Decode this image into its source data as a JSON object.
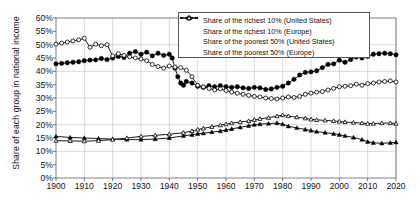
{
  "chart_data": {
    "type": "line",
    "title": "",
    "xlabel": "",
    "ylabel": "Share of each group in national income",
    "xlim": [
      1900,
      2020
    ],
    "ylim": [
      0,
      60
    ],
    "y_unit": "%",
    "grid": true,
    "legend_position": "top-right",
    "xticks": [
      1900,
      1910,
      1920,
      1930,
      1940,
      1950,
      1960,
      1970,
      1980,
      1990,
      2000,
      2010,
      2020
    ],
    "ytick_labels": [
      "0%",
      "5%",
      "10%",
      "15%",
      "20%",
      "25%",
      "30%",
      "35%",
      "40%",
      "45%",
      "50%",
      "55%",
      "60%"
    ],
    "yticks": [
      0,
      5,
      10,
      15,
      20,
      25,
      30,
      35,
      40,
      45,
      50,
      55,
      60
    ],
    "colors": {
      "filled": "#000000",
      "hollow": "#000000",
      "grid": "#c9c9c9",
      "axis": "#808080"
    },
    "series": [
      {
        "name": "Share of the richest 10% (United States)",
        "marker": "filled-circle",
        "x": [
          1900,
          1902,
          1904,
          1906,
          1908,
          1910,
          1912,
          1914,
          1916,
          1918,
          1920,
          1922,
          1924,
          1926,
          1928,
          1930,
          1932,
          1934,
          1936,
          1938,
          1940,
          1941,
          1942,
          1943,
          1944,
          1945,
          1946,
          1948,
          1950,
          1952,
          1954,
          1956,
          1958,
          1960,
          1962,
          1964,
          1966,
          1968,
          1970,
          1972,
          1974,
          1976,
          1978,
          1980,
          1982,
          1984,
          1986,
          1988,
          1990,
          1992,
          1994,
          1996,
          1998,
          2000,
          2002,
          2004,
          2006,
          2008,
          2010,
          2012,
          2014,
          2016,
          2018,
          2020
        ],
        "values": [
          42.8,
          43.0,
          43.2,
          43.4,
          43.6,
          44.0,
          44.2,
          44.3,
          44.8,
          44.4,
          45.0,
          45.6,
          45.2,
          46.8,
          47.4,
          46.4,
          47.2,
          45.8,
          46.8,
          46.0,
          46.4,
          45.0,
          41.2,
          38.0,
          35.6,
          34.8,
          36.2,
          35.6,
          34.4,
          34.0,
          34.6,
          34.2,
          34.6,
          34.2,
          34.0,
          34.2,
          33.8,
          33.6,
          34.0,
          33.8,
          33.2,
          33.4,
          34.0,
          34.4,
          35.6,
          37.0,
          38.6,
          39.6,
          39.8,
          40.2,
          41.4,
          42.6,
          42.8,
          44.2,
          43.4,
          44.4,
          45.4,
          45.0,
          45.6,
          46.4,
          46.6,
          46.8,
          46.6,
          46.2
        ]
      },
      {
        "name": "Share of the richest 10% (Europe)",
        "marker": "hollow-circle",
        "x": [
          1900,
          1902,
          1904,
          1906,
          1908,
          1910,
          1912,
          1914,
          1916,
          1918,
          1920,
          1922,
          1924,
          1926,
          1928,
          1930,
          1932,
          1934,
          1936,
          1938,
          1940,
          1942,
          1944,
          1946,
          1948,
          1950,
          1952,
          1954,
          1956,
          1958,
          1960,
          1962,
          1964,
          1966,
          1968,
          1970,
          1972,
          1974,
          1976,
          1978,
          1980,
          1982,
          1984,
          1986,
          1988,
          1990,
          1992,
          1994,
          1996,
          1998,
          2000,
          2002,
          2004,
          2006,
          2008,
          2010,
          2012,
          2014,
          2016,
          2018,
          2020
        ],
        "values": [
          50.2,
          50.6,
          51.0,
          51.4,
          51.8,
          52.4,
          49.0,
          50.2,
          49.6,
          50.0,
          45.8,
          46.6,
          46.0,
          45.4,
          45.0,
          44.6,
          44.0,
          42.6,
          41.8,
          41.2,
          42.0,
          41.6,
          41.4,
          40.4,
          38.0,
          34.8,
          34.2,
          33.6,
          33.0,
          33.4,
          32.8,
          32.2,
          31.8,
          31.4,
          31.0,
          30.6,
          30.4,
          30.0,
          29.8,
          29.6,
          30.0,
          30.4,
          30.2,
          30.6,
          31.4,
          31.8,
          32.2,
          32.4,
          33.0,
          33.6,
          34.2,
          34.4,
          34.6,
          35.2,
          34.8,
          35.4,
          35.6,
          36.0,
          36.2,
          36.4,
          36.0
        ]
      },
      {
        "name": "Share of the poorest 50% (United States)",
        "marker": "filled-triangle",
        "x": [
          1900,
          1905,
          1910,
          1915,
          1920,
          1925,
          1930,
          1935,
          1940,
          1945,
          1948,
          1950,
          1952,
          1955,
          1958,
          1960,
          1962,
          1965,
          1968,
          1970,
          1972,
          1975,
          1978,
          1980,
          1982,
          1985,
          1988,
          1990,
          1992,
          1995,
          1998,
          2000,
          2002,
          2005,
          2008,
          2010,
          2012,
          2015,
          2018,
          2020
        ],
        "values": [
          15.6,
          15.2,
          15.0,
          14.8,
          14.6,
          14.4,
          14.4,
          14.6,
          15.0,
          15.8,
          16.2,
          16.6,
          16.8,
          17.2,
          17.6,
          18.0,
          18.4,
          19.0,
          19.6,
          20.0,
          20.2,
          20.4,
          20.6,
          20.2,
          19.4,
          18.8,
          18.2,
          17.8,
          17.4,
          17.0,
          16.6,
          16.2,
          15.8,
          15.2,
          14.4,
          13.6,
          13.2,
          13.0,
          13.2,
          13.4
        ]
      },
      {
        "name": "Share of the poorest 50% (Europe)",
        "marker": "hollow-triangle",
        "x": [
          1900,
          1905,
          1910,
          1915,
          1920,
          1925,
          1930,
          1935,
          1940,
          1945,
          1948,
          1950,
          1952,
          1955,
          1958,
          1960,
          1962,
          1965,
          1968,
          1970,
          1972,
          1975,
          1978,
          1980,
          1982,
          1985,
          1988,
          1990,
          1992,
          1995,
          1998,
          2000,
          2002,
          2005,
          2008,
          2010,
          2012,
          2015,
          2018,
          2020
        ],
        "values": [
          14.0,
          13.9,
          13.8,
          14.0,
          14.4,
          15.0,
          15.6,
          16.0,
          16.4,
          17.0,
          17.6,
          18.2,
          18.6,
          19.2,
          19.8,
          20.2,
          20.6,
          21.0,
          21.4,
          21.8,
          22.2,
          22.6,
          23.2,
          23.6,
          23.2,
          22.8,
          22.4,
          22.0,
          21.8,
          21.6,
          21.4,
          21.2,
          21.0,
          20.8,
          20.6,
          20.4,
          20.4,
          20.6,
          20.6,
          20.4
        ]
      }
    ]
  },
  "legend": {
    "items": [
      {
        "label": "Share of the richest 10% (United States)",
        "marker": "filled-circle"
      },
      {
        "label": "Share of the richest 10% (Europe)",
        "marker": "hollow-circle"
      },
      {
        "label": "Share of the poorest 50% (United States)",
        "marker": "filled-triangle"
      },
      {
        "label": "Share of the poorest 50% (Europe)",
        "marker": "hollow-triangle"
      }
    ]
  }
}
